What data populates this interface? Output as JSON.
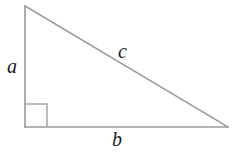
{
  "figure": {
    "type": "geometry-diagram",
    "background_color": "#ffffff",
    "line_color": "#9a9a9a",
    "label_color": "#1b1b1b",
    "canvas": {
      "width": 239,
      "height": 164
    },
    "vertices": {
      "apex": {
        "x": 25,
        "y": 6
      },
      "right_angle": {
        "x": 25,
        "y": 127
      },
      "base_right": {
        "x": 228,
        "y": 127
      }
    },
    "right_angle_marker": {
      "present": true,
      "size": 22,
      "corner": {
        "x": 25,
        "y": 127
      }
    },
    "labels": {
      "leg_vertical": "a",
      "hypotenuse": "c",
      "leg_horizontal": "b"
    }
  }
}
